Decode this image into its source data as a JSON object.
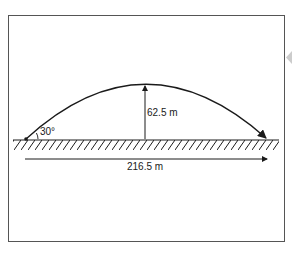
{
  "diagram": {
    "type": "projectile-motion",
    "launch_angle_label": "30°",
    "max_height_label": "62.5 m",
    "range_label": "216.5 m",
    "colors": {
      "stroke": "#1a1a1a",
      "frame": "#555555",
      "side_marker": "#cccccc",
      "background": "#ffffff"
    }
  }
}
